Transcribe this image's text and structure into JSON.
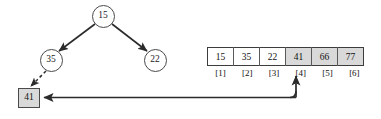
{
  "diagram": {
    "type": "tree-and-array",
    "colors": {
      "background": "#ffffff",
      "stroke": "#3d3d3d",
      "shade": "#d9d9d9",
      "text": "#111111"
    },
    "tree": {
      "nodes": [
        {
          "id": "root",
          "label": "15",
          "cx": 103,
          "cy": 16,
          "r": 11.5,
          "shape": "circle"
        },
        {
          "id": "left",
          "label": "35",
          "cx": 51,
          "cy": 60,
          "r": 11.5,
          "shape": "circle"
        },
        {
          "id": "right",
          "label": "22",
          "cx": 155,
          "cy": 60,
          "r": 11.5,
          "shape": "circle"
        },
        {
          "id": "new",
          "label": "41",
          "x": 18,
          "y": 88,
          "w": 22,
          "h": 20,
          "shape": "box",
          "shaded": true
        }
      ],
      "edges": [
        {
          "from": "root",
          "to": "left",
          "style": "solid",
          "arrow": true
        },
        {
          "from": "root",
          "to": "right",
          "style": "solid",
          "arrow": true
        },
        {
          "from": "left",
          "to": "new",
          "style": "dashed",
          "arrow": true
        }
      ]
    },
    "array": {
      "cells": [
        {
          "value": "15",
          "index": "[1]",
          "shaded": false
        },
        {
          "value": "35",
          "index": "[2]",
          "shaded": false
        },
        {
          "value": "22",
          "index": "[3]",
          "shaded": false
        },
        {
          "value": "41",
          "index": "[4]",
          "shaded": true
        },
        {
          "value": "66",
          "index": "[5]",
          "shaded": true
        },
        {
          "value": "77",
          "index": "[6]",
          "shaded": true
        }
      ]
    },
    "pointer": {
      "description": "arrow from array slot [4] down then left to the 41 node box",
      "from_index": "[4]",
      "to_node": "41",
      "style": "solid",
      "arrowheads": "both-ends"
    }
  }
}
